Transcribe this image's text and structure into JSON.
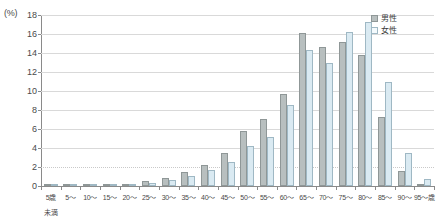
{
  "chart_data": {
    "type": "bar",
    "title": "",
    "xlabel": "",
    "ylabel": "(%)",
    "ylim": [
      0,
      18
    ],
    "ytick_step": 2,
    "grid": true,
    "legend_position": "top-right",
    "categories": [
      "5歳\n未満",
      "5～",
      "10～",
      "15～",
      "20～",
      "25～",
      "30～",
      "35～",
      "40～",
      "45～",
      "50～",
      "55～",
      "60～",
      "65～",
      "70～",
      "75～",
      "80～",
      "85～",
      "90～",
      "95～歳"
    ],
    "category_labels_line1": [
      "5歳",
      "5～",
      "10～",
      "15～",
      "20～",
      "25～",
      "30～",
      "35～",
      "40～",
      "45～",
      "50～",
      "55～",
      "60～",
      "65～",
      "70～",
      "75～",
      "80～",
      "85～",
      "90～",
      "95～歳"
    ],
    "category_labels_line2": [
      "未満",
      "",
      "",
      "",
      "",
      "",
      "",
      "",
      "",
      "",
      "",
      "",
      "",
      "",
      "",
      "",
      "",
      "",
      "",
      ""
    ],
    "ytick_labels": [
      "0",
      "2",
      "4",
      "6",
      "8",
      "10",
      "12",
      "14",
      "16",
      "18"
    ],
    "ytick_values": [
      0,
      2,
      4,
      6,
      8,
      10,
      12,
      14,
      16,
      18
    ],
    "series": [
      {
        "name": "男性",
        "color": "#b8bfbf",
        "values": [
          0.0,
          0.05,
          0.1,
          0.2,
          0.25,
          0.5,
          0.8,
          1.5,
          2.2,
          3.5,
          5.8,
          7.1,
          9.7,
          16.1,
          14.6,
          15.2,
          13.8,
          7.3,
          1.6,
          0.2
        ]
      },
      {
        "name": "女性",
        "color": "#daeaf2",
        "values": [
          0.0,
          0.05,
          0.1,
          0.15,
          0.2,
          0.35,
          0.6,
          1.1,
          1.7,
          2.5,
          4.2,
          5.2,
          8.5,
          14.3,
          13.0,
          16.2,
          17.3,
          11.0,
          3.5,
          0.7
        ]
      }
    ]
  },
  "legend": {
    "items": [
      {
        "label": "男性",
        "swatch": "male"
      },
      {
        "label": "女性",
        "swatch": "female"
      }
    ]
  },
  "axis": {
    "unit_label": "(%)"
  }
}
